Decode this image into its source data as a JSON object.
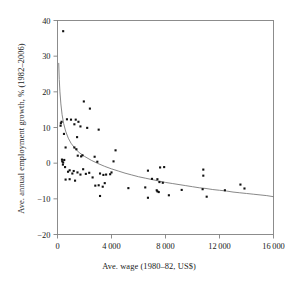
{
  "chart_data": {
    "type": "scatter",
    "title": "",
    "xlabel": "Ave. wage (1980–82, US$)",
    "ylabel": "Ave. annual employment growth, % (1982–2006)",
    "xlim": [
      0,
      16000
    ],
    "ylim": [
      -20,
      40
    ],
    "xticks": [
      0,
      4000,
      8000,
      12000,
      16000
    ],
    "xtick_labels": [
      "0",
      "4 000",
      "8 000",
      "12 000",
      "16 000"
    ],
    "yticks": [
      -20,
      -10,
      0,
      10,
      20,
      30,
      40
    ],
    "ytick_labels": [
      "−20",
      "−10",
      "0",
      "10",
      "20",
      "30",
      "40"
    ],
    "grid": false,
    "legend": null,
    "marker_color": "#111111",
    "marker_size": 2.1,
    "axis_color": "#808080",
    "fit_curve": {
      "name": "logarithmic trend",
      "color": "#7a7a7a",
      "width": 0.9,
      "points": [
        [
          90,
          28.0
        ],
        [
          130,
          23.5
        ],
        [
          180,
          20.0
        ],
        [
          250,
          16.6
        ],
        [
          340,
          13.6
        ],
        [
          450,
          11.2
        ],
        [
          600,
          9.0
        ],
        [
          800,
          7.0
        ],
        [
          1000,
          5.6
        ],
        [
          1300,
          4.1
        ],
        [
          1600,
          3.0
        ],
        [
          2000,
          1.9
        ],
        [
          2500,
          0.8
        ],
        [
          3000,
          -0.1
        ],
        [
          3500,
          -0.9
        ],
        [
          4000,
          -1.6
        ],
        [
          4500,
          -2.2
        ],
        [
          5000,
          -2.8
        ],
        [
          5500,
          -3.3
        ],
        [
          6000,
          -3.8
        ],
        [
          6500,
          -4.2
        ],
        [
          7000,
          -4.6
        ],
        [
          7500,
          -5.0
        ],
        [
          8000,
          -5.4
        ],
        [
          8500,
          -5.7
        ],
        [
          9000,
          -6.0
        ],
        [
          9500,
          -6.3
        ],
        [
          10000,
          -6.6
        ],
        [
          10500,
          -6.9
        ],
        [
          11000,
          -7.1
        ],
        [
          11500,
          -7.4
        ],
        [
          12000,
          -7.6
        ],
        [
          12500,
          -7.8
        ],
        [
          13000,
          -8.1
        ],
        [
          13500,
          -8.3
        ],
        [
          14000,
          -8.5
        ],
        [
          14500,
          -8.7
        ],
        [
          15000,
          -8.9
        ],
        [
          15500,
          -9.1
        ],
        [
          16000,
          -9.4
        ]
      ]
    },
    "points": [
      [
        420,
        37.0
      ],
      [
        1950,
        17.3
      ],
      [
        2400,
        15.3
      ],
      [
        700,
        12.3
      ],
      [
        1000,
        12.2
      ],
      [
        1350,
        12.2
      ],
      [
        300,
        11.6
      ],
      [
        250,
        11.2
      ],
      [
        230,
        10.5
      ],
      [
        1250,
        10.9
      ],
      [
        1550,
        11.6
      ],
      [
        1700,
        10.3
      ],
      [
        2200,
        9.9
      ],
      [
        3050,
        9.4
      ],
      [
        480,
        8.2
      ],
      [
        1450,
        7.3
      ],
      [
        600,
        4.4
      ],
      [
        1250,
        4.4
      ],
      [
        1400,
        3.9
      ],
      [
        4300,
        3.6
      ],
      [
        330,
        1.0
      ],
      [
        350,
        0.5
      ],
      [
        420,
        0.2
      ],
      [
        500,
        0.9
      ],
      [
        1500,
        2.1
      ],
      [
        1750,
        1.9
      ],
      [
        1850,
        2.2
      ],
      [
        2750,
        1.8
      ],
      [
        2950,
        0.4
      ],
      [
        4150,
        0.5
      ],
      [
        400,
        -0.4
      ],
      [
        560,
        -1.1
      ],
      [
        780,
        -2.4
      ],
      [
        900,
        -2.0
      ],
      [
        1100,
        -2.9
      ],
      [
        1200,
        -2.2
      ],
      [
        1480,
        -2.6
      ],
      [
        1700,
        -3.2
      ],
      [
        1900,
        -1.7
      ],
      [
        2100,
        -3.0
      ],
      [
        3150,
        -2.9
      ],
      [
        3400,
        -3.3
      ],
      [
        3600,
        -3.2
      ],
      [
        3900,
        -3.1
      ],
      [
        4000,
        -2.6
      ],
      [
        6700,
        -2.1
      ],
      [
        7600,
        -1.2
      ],
      [
        7900,
        -1.1
      ],
      [
        10800,
        -1.8
      ],
      [
        10800,
        -3.5
      ],
      [
        600,
        -4.6
      ],
      [
        900,
        -4.5
      ],
      [
        1300,
        -4.9
      ],
      [
        2350,
        -2.7
      ],
      [
        2600,
        -4.0
      ],
      [
        2800,
        -6.3
      ],
      [
        3050,
        -6.2
      ],
      [
        3350,
        -6.6
      ],
      [
        3500,
        -5.6
      ],
      [
        7000,
        -4.4
      ],
      [
        7400,
        -4.5
      ],
      [
        7550,
        -5.3
      ],
      [
        7800,
        -5.5
      ],
      [
        6500,
        -6.8
      ],
      [
        5250,
        -7.0
      ],
      [
        7350,
        -7.6
      ],
      [
        7400,
        -7.9
      ],
      [
        7500,
        -8.1
      ],
      [
        9200,
        -7.5
      ],
      [
        10750,
        -7.3
      ],
      [
        12400,
        -7.6
      ],
      [
        13850,
        -7.1
      ],
      [
        13550,
        -6.0
      ],
      [
        3150,
        -9.2
      ],
      [
        6700,
        -9.7
      ],
      [
        8250,
        -9.0
      ],
      [
        11050,
        -9.4
      ]
    ]
  }
}
